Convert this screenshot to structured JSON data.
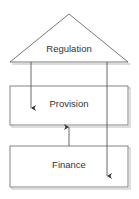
{
  "diagram": {
    "nodes": [
      {
        "id": "regulation",
        "label": "Regulation",
        "shape": "triangle"
      },
      {
        "id": "provision",
        "label": "Provision",
        "shape": "rectangle"
      },
      {
        "id": "finance",
        "label": "Finance",
        "shape": "rectangle"
      }
    ],
    "edges": [
      {
        "from": "regulation",
        "to": "provision"
      },
      {
        "from": "regulation",
        "to": "finance"
      },
      {
        "from": "finance",
        "to": "provision"
      }
    ],
    "colors": {
      "stroke": "#555555",
      "shadow": "#c8c8c8",
      "text": "#333333",
      "background": "#ffffff"
    }
  }
}
